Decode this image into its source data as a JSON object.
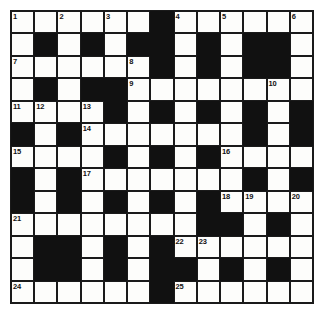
{
  "puzzle": {
    "type": "crossword-grid",
    "rows": 13,
    "columns": 13,
    "colors": {
      "block": "#111111",
      "cell": "#fdfdfb",
      "grid_line": "#1a1a1a",
      "number_text": "#111111",
      "page_background": "#ffffff"
    },
    "clue_numbers": [
      1,
      2,
      3,
      4,
      5,
      6,
      7,
      8,
      9,
      10,
      11,
      12,
      13,
      14,
      15,
      16,
      17,
      18,
      19,
      20,
      21,
      22,
      23,
      24,
      25
    ],
    "grid": [
      [
        {
          "block": false,
          "num": "1"
        },
        {
          "block": false,
          "num": ""
        },
        {
          "block": false,
          "num": "2"
        },
        {
          "block": false,
          "num": ""
        },
        {
          "block": false,
          "num": "3"
        },
        {
          "block": false,
          "num": ""
        },
        {
          "block": true,
          "num": ""
        },
        {
          "block": false,
          "num": "4"
        },
        {
          "block": false,
          "num": ""
        },
        {
          "block": false,
          "num": "5"
        },
        {
          "block": false,
          "num": ""
        },
        {
          "block": false,
          "num": ""
        },
        {
          "block": false,
          "num": "6"
        }
      ],
      [
        {
          "block": false,
          "num": ""
        },
        {
          "block": true,
          "num": ""
        },
        {
          "block": false,
          "num": ""
        },
        {
          "block": true,
          "num": ""
        },
        {
          "block": false,
          "num": ""
        },
        {
          "block": true,
          "num": ""
        },
        {
          "block": true,
          "num": ""
        },
        {
          "block": false,
          "num": ""
        },
        {
          "block": true,
          "num": ""
        },
        {
          "block": false,
          "num": ""
        },
        {
          "block": true,
          "num": ""
        },
        {
          "block": true,
          "num": ""
        },
        {
          "block": false,
          "num": ""
        }
      ],
      [
        {
          "block": false,
          "num": "7"
        },
        {
          "block": false,
          "num": ""
        },
        {
          "block": false,
          "num": ""
        },
        {
          "block": false,
          "num": ""
        },
        {
          "block": false,
          "num": ""
        },
        {
          "block": false,
          "num": "8"
        },
        {
          "block": true,
          "num": ""
        },
        {
          "block": false,
          "num": ""
        },
        {
          "block": true,
          "num": ""
        },
        {
          "block": false,
          "num": ""
        },
        {
          "block": true,
          "num": ""
        },
        {
          "block": true,
          "num": ""
        },
        {
          "block": false,
          "num": ""
        }
      ],
      [
        {
          "block": false,
          "num": ""
        },
        {
          "block": true,
          "num": ""
        },
        {
          "block": false,
          "num": ""
        },
        {
          "block": true,
          "num": ""
        },
        {
          "block": true,
          "num": ""
        },
        {
          "block": false,
          "num": "9"
        },
        {
          "block": false,
          "num": ""
        },
        {
          "block": false,
          "num": ""
        },
        {
          "block": false,
          "num": ""
        },
        {
          "block": false,
          "num": ""
        },
        {
          "block": false,
          "num": ""
        },
        {
          "block": false,
          "num": "10"
        },
        {
          "block": false,
          "num": ""
        }
      ],
      [
        {
          "block": false,
          "num": "11"
        },
        {
          "block": false,
          "num": "12"
        },
        {
          "block": false,
          "num": ""
        },
        {
          "block": false,
          "num": "13"
        },
        {
          "block": true,
          "num": ""
        },
        {
          "block": false,
          "num": ""
        },
        {
          "block": true,
          "num": ""
        },
        {
          "block": false,
          "num": ""
        },
        {
          "block": true,
          "num": ""
        },
        {
          "block": false,
          "num": ""
        },
        {
          "block": true,
          "num": ""
        },
        {
          "block": false,
          "num": ""
        },
        {
          "block": true,
          "num": ""
        }
      ],
      [
        {
          "block": true,
          "num": ""
        },
        {
          "block": false,
          "num": ""
        },
        {
          "block": true,
          "num": ""
        },
        {
          "block": false,
          "num": "14"
        },
        {
          "block": false,
          "num": ""
        },
        {
          "block": false,
          "num": ""
        },
        {
          "block": false,
          "num": ""
        },
        {
          "block": false,
          "num": ""
        },
        {
          "block": false,
          "num": ""
        },
        {
          "block": false,
          "num": ""
        },
        {
          "block": true,
          "num": ""
        },
        {
          "block": false,
          "num": ""
        },
        {
          "block": true,
          "num": ""
        }
      ],
      [
        {
          "block": false,
          "num": "15"
        },
        {
          "block": false,
          "num": ""
        },
        {
          "block": false,
          "num": ""
        },
        {
          "block": false,
          "num": ""
        },
        {
          "block": true,
          "num": ""
        },
        {
          "block": false,
          "num": ""
        },
        {
          "block": true,
          "num": ""
        },
        {
          "block": false,
          "num": ""
        },
        {
          "block": true,
          "num": ""
        },
        {
          "block": false,
          "num": "16"
        },
        {
          "block": false,
          "num": ""
        },
        {
          "block": false,
          "num": ""
        },
        {
          "block": false,
          "num": ""
        }
      ],
      [
        {
          "block": true,
          "num": ""
        },
        {
          "block": false,
          "num": ""
        },
        {
          "block": true,
          "num": ""
        },
        {
          "block": false,
          "num": "17"
        },
        {
          "block": false,
          "num": ""
        },
        {
          "block": false,
          "num": ""
        },
        {
          "block": false,
          "num": ""
        },
        {
          "block": false,
          "num": ""
        },
        {
          "block": false,
          "num": ""
        },
        {
          "block": false,
          "num": ""
        },
        {
          "block": true,
          "num": ""
        },
        {
          "block": false,
          "num": ""
        },
        {
          "block": true,
          "num": ""
        }
      ],
      [
        {
          "block": true,
          "num": ""
        },
        {
          "block": false,
          "num": ""
        },
        {
          "block": true,
          "num": ""
        },
        {
          "block": false,
          "num": ""
        },
        {
          "block": true,
          "num": ""
        },
        {
          "block": false,
          "num": ""
        },
        {
          "block": true,
          "num": ""
        },
        {
          "block": false,
          "num": ""
        },
        {
          "block": true,
          "num": ""
        },
        {
          "block": false,
          "num": "18"
        },
        {
          "block": false,
          "num": "19"
        },
        {
          "block": false,
          "num": ""
        },
        {
          "block": false,
          "num": "20"
        }
      ],
      [
        {
          "block": false,
          "num": "21"
        },
        {
          "block": false,
          "num": ""
        },
        {
          "block": false,
          "num": ""
        },
        {
          "block": false,
          "num": ""
        },
        {
          "block": false,
          "num": ""
        },
        {
          "block": false,
          "num": ""
        },
        {
          "block": false,
          "num": ""
        },
        {
          "block": false,
          "num": ""
        },
        {
          "block": true,
          "num": ""
        },
        {
          "block": true,
          "num": ""
        },
        {
          "block": false,
          "num": ""
        },
        {
          "block": true,
          "num": ""
        },
        {
          "block": false,
          "num": ""
        }
      ],
      [
        {
          "block": false,
          "num": ""
        },
        {
          "block": true,
          "num": ""
        },
        {
          "block": true,
          "num": ""
        },
        {
          "block": false,
          "num": ""
        },
        {
          "block": true,
          "num": ""
        },
        {
          "block": false,
          "num": ""
        },
        {
          "block": true,
          "num": ""
        },
        {
          "block": false,
          "num": "22"
        },
        {
          "block": false,
          "num": "23"
        },
        {
          "block": false,
          "num": ""
        },
        {
          "block": false,
          "num": ""
        },
        {
          "block": false,
          "num": ""
        },
        {
          "block": false,
          "num": ""
        }
      ],
      [
        {
          "block": false,
          "num": ""
        },
        {
          "block": true,
          "num": ""
        },
        {
          "block": true,
          "num": ""
        },
        {
          "block": false,
          "num": ""
        },
        {
          "block": true,
          "num": ""
        },
        {
          "block": false,
          "num": ""
        },
        {
          "block": true,
          "num": ""
        },
        {
          "block": true,
          "num": ""
        },
        {
          "block": false,
          "num": ""
        },
        {
          "block": true,
          "num": ""
        },
        {
          "block": false,
          "num": ""
        },
        {
          "block": true,
          "num": ""
        },
        {
          "block": false,
          "num": ""
        }
      ],
      [
        {
          "block": false,
          "num": "24"
        },
        {
          "block": false,
          "num": ""
        },
        {
          "block": false,
          "num": ""
        },
        {
          "block": false,
          "num": ""
        },
        {
          "block": false,
          "num": ""
        },
        {
          "block": false,
          "num": ""
        },
        {
          "block": true,
          "num": ""
        },
        {
          "block": false,
          "num": "25"
        },
        {
          "block": false,
          "num": ""
        },
        {
          "block": false,
          "num": ""
        },
        {
          "block": false,
          "num": ""
        },
        {
          "block": false,
          "num": ""
        },
        {
          "block": false,
          "num": ""
        }
      ]
    ]
  }
}
